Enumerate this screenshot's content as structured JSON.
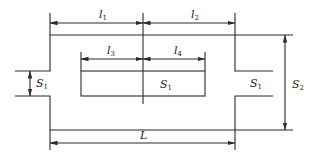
{
  "diagram": {
    "type": "expansion-chamber-muffler-schematic",
    "line_color": "#2a2a2a",
    "labels": {
      "l1": {
        "base": "l",
        "sub": "1"
      },
      "l2": {
        "base": "l",
        "sub": "2"
      },
      "l3": {
        "base": "l",
        "sub": "3"
      },
      "l4": {
        "base": "l",
        "sub": "4"
      },
      "S1_left": {
        "base": "S",
        "sub": "1"
      },
      "S1_center": {
        "base": "S",
        "sub": "1"
      },
      "S1_right": {
        "base": "S",
        "sub": "1"
      },
      "S2": {
        "base": "S",
        "sub": "2"
      },
      "L": {
        "base": "L",
        "sub": ""
      }
    }
  }
}
